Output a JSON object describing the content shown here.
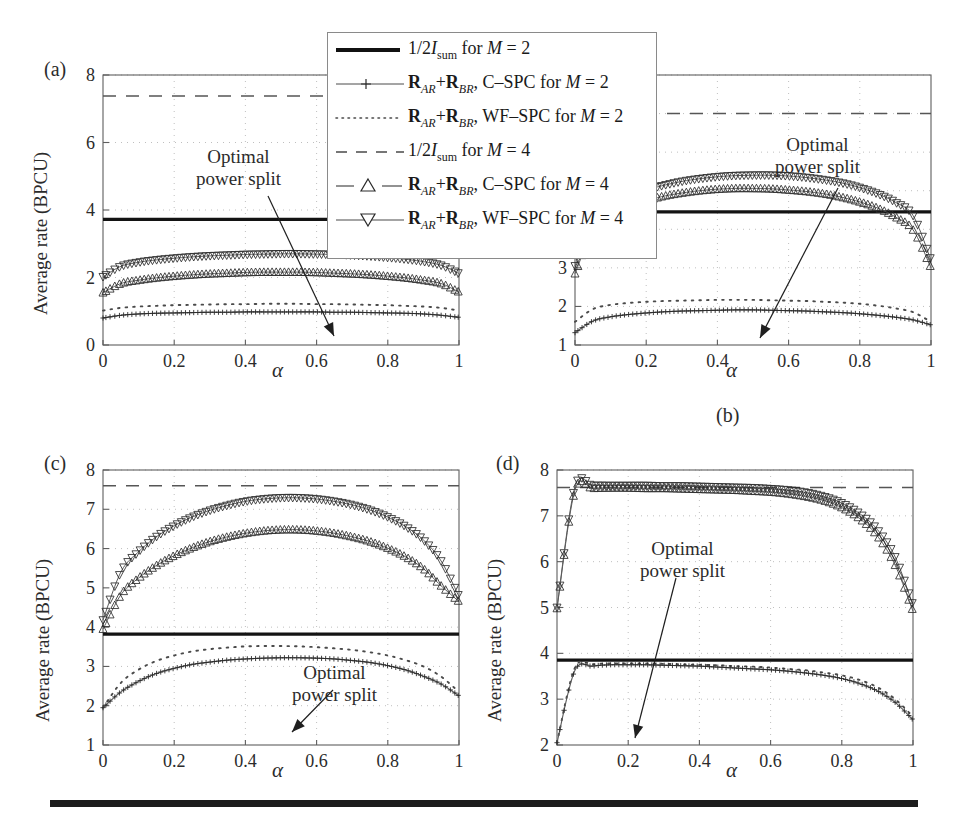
{
  "figure": {
    "bottom_rule_color": "#1c1c1c"
  },
  "legend": {
    "entries": [
      {
        "id": "half-isum-m2",
        "style": "solid-thick",
        "label_html": "1/2<i>I</i><sub>sum</sub> for <i>M</i> = 2",
        "label": "1/2 I_sum for M = 2"
      },
      {
        "id": "rar-rbr-cspc-m2",
        "style": "plus-line",
        "label_html": "<b>R</b><i><sub>AR</sub></i>+<b>R</b><i><sub>BR</sub></i>, C–SPC for <i>M</i> = 2",
        "label": "R_AR+R_BR, C-SPC for M = 2"
      },
      {
        "id": "rar-rbr-wfspc-m2",
        "style": "dotted",
        "label_html": "<b>R</b><i><sub>AR</sub></i>+<b>R</b><i><sub>BR</sub></i>, WF–SPC for <i>M</i> = 2",
        "label": "R_AR+R_BR, WF-SPC for M = 2"
      },
      {
        "id": "half-isum-m4",
        "style": "dashed",
        "label_html": "1/2<i>I</i><sub>sum</sub> for <i>M</i> = 4",
        "label": "1/2 I_sum for M = 4"
      },
      {
        "id": "rar-rbr-cspc-m4",
        "style": "dash-triangle-up",
        "label_html": "<b>R</b><i><sub>AR</sub></i>+<b>R</b><i><sub>BR</sub></i>, C–SPC for <i>M</i> = 4",
        "label": "R_AR+R_BR, C-SPC for M = 4"
      },
      {
        "id": "rar-rbr-wfspc-m4",
        "style": "line-triangle-down",
        "label_html": "<b>R</b><i><sub>AR</sub></i>+<b>R</b><i><sub>BR</sub></i>, WF–SPC for <i>M</i> = 4",
        "label": "R_AR+R_BR, WF-SPC for M = 4"
      }
    ]
  },
  "annotations": {
    "optimal_line1": "Optimal",
    "optimal_line2": "power split"
  },
  "chart_data": [
    {
      "id": "panel-a",
      "type": "line",
      "panel_label": "(a)",
      "title": "",
      "xlabel": "α",
      "ylabel": "Average rate (BPCU)",
      "xlim": [
        0,
        1
      ],
      "ylim": [
        0,
        8
      ],
      "xticks": [
        "0",
        "0.2",
        "0.4",
        "0.6",
        "0.8",
        "1"
      ],
      "xtick_values": [
        0,
        0.2,
        0.4,
        0.6,
        0.8,
        1
      ],
      "yticks": [
        "0",
        "2",
        "4",
        "6",
        "8"
      ],
      "ytick_values": [
        0,
        2,
        4,
        6,
        8
      ],
      "grid": true,
      "annotation": {
        "text": "Optimal power split",
        "arrow_to_x": 0.6,
        "arrow_to_y": 0.3
      },
      "x": [
        0,
        0.05,
        0.1,
        0.15,
        0.2,
        0.25,
        0.3,
        0.35,
        0.4,
        0.45,
        0.5,
        0.55,
        0.6,
        0.65,
        0.7,
        0.75,
        0.8,
        0.85,
        0.9,
        0.95,
        1
      ],
      "series": [
        {
          "name": "1/2 I_sum for M = 2",
          "style": "solid-thick",
          "values": [
            3.72,
            3.72,
            3.72,
            3.72,
            3.72,
            3.72,
            3.72,
            3.72,
            3.72,
            3.72,
            3.72,
            3.72,
            3.72,
            3.72,
            3.72,
            3.72,
            3.72,
            3.72,
            3.72,
            3.72,
            3.72
          ]
        },
        {
          "name": "1/2 I_sum for M = 4",
          "style": "dashed",
          "values": [
            7.38,
            7.38,
            7.38,
            7.38,
            7.38,
            7.38,
            7.38,
            7.38,
            7.38,
            7.38,
            7.38,
            7.38,
            7.38,
            7.38,
            7.38,
            7.38,
            7.38,
            7.38,
            7.38,
            7.38,
            7.38
          ]
        },
        {
          "name": "R_AR+R_BR, WF-SPC for M = 4",
          "style": "line-triangle-down",
          "values": [
            2.02,
            2.33,
            2.45,
            2.52,
            2.57,
            2.61,
            2.64,
            2.66,
            2.68,
            2.69,
            2.7,
            2.7,
            2.69,
            2.68,
            2.66,
            2.63,
            2.59,
            2.54,
            2.47,
            2.36,
            2.12
          ]
        },
        {
          "name": "R_AR+R_BR, C-SPC for M = 4",
          "style": "dash-triangle-up",
          "values": [
            1.55,
            1.82,
            1.92,
            1.99,
            2.04,
            2.08,
            2.11,
            2.13,
            2.15,
            2.16,
            2.16,
            2.16,
            2.15,
            2.13,
            2.11,
            2.08,
            2.04,
            1.99,
            1.92,
            1.82,
            1.57
          ]
        },
        {
          "name": "R_AR+R_BR, WF-SPC for M = 2",
          "style": "dotted",
          "values": [
            1.02,
            1.1,
            1.14,
            1.16,
            1.18,
            1.19,
            1.2,
            1.21,
            1.21,
            1.22,
            1.22,
            1.22,
            1.21,
            1.21,
            1.2,
            1.19,
            1.18,
            1.16,
            1.14,
            1.1,
            1.02
          ]
        },
        {
          "name": "R_AR+R_BR, C-SPC for M = 2",
          "style": "plus-line",
          "values": [
            0.8,
            0.88,
            0.92,
            0.94,
            0.95,
            0.96,
            0.97,
            0.97,
            0.98,
            0.98,
            0.98,
            0.98,
            0.98,
            0.97,
            0.97,
            0.96,
            0.95,
            0.94,
            0.92,
            0.88,
            0.82
          ]
        }
      ]
    },
    {
      "id": "panel-b",
      "type": "line",
      "panel_label": "(b)",
      "title": "",
      "xlabel": "α",
      "ylabel": "Average rate (BPCU)",
      "xlim": [
        0,
        1
      ],
      "ylim": [
        1,
        8
      ],
      "xticks": [
        "0",
        "0.2",
        "0.4",
        "0.6",
        "0.8",
        "1"
      ],
      "xtick_values": [
        0,
        0.2,
        0.4,
        0.6,
        0.8,
        1
      ],
      "yticks": [
        "1",
        "2",
        "3",
        "4",
        "5",
        "6",
        "7",
        "8"
      ],
      "ytick_values": [
        1,
        2,
        3,
        4,
        5,
        6,
        7,
        8
      ],
      "grid": true,
      "annotation": {
        "text": "Optimal power split",
        "arrow_to_x": 0.51,
        "arrow_to_y": 1.05
      },
      "x": [
        0,
        0.05,
        0.1,
        0.15,
        0.2,
        0.25,
        0.3,
        0.35,
        0.4,
        0.45,
        0.5,
        0.55,
        0.6,
        0.65,
        0.7,
        0.75,
        0.8,
        0.85,
        0.9,
        0.95,
        1
      ],
      "series": [
        {
          "name": "1/2 I_sum for M = 2",
          "style": "solid-thick",
          "values": [
            4.45,
            4.45,
            4.45,
            4.45,
            4.45,
            4.45,
            4.45,
            4.45,
            4.45,
            4.45,
            4.45,
            4.45,
            4.45,
            4.45,
            4.45,
            4.45,
            4.45,
            4.45,
            4.45,
            4.45,
            4.45
          ]
        },
        {
          "name": "1/2 I_sum for M = 4",
          "style": "dashed",
          "values": [
            7.0,
            7.0,
            7.0,
            7.0,
            7.0,
            7.0,
            7.0,
            7.0,
            7.0,
            7.0,
            7.0,
            7.0,
            7.0,
            7.0,
            7.0,
            7.0,
            7.0,
            7.0,
            7.0,
            7.0,
            7.0
          ]
        },
        {
          "name": "R_AR+R_BR, WF-SPC for M = 4",
          "style": "line-triangle-down",
          "values": [
            3.05,
            4.2,
            4.6,
            4.85,
            5.02,
            5.14,
            5.24,
            5.31,
            5.36,
            5.39,
            5.4,
            5.4,
            5.38,
            5.34,
            5.28,
            5.2,
            5.08,
            4.92,
            4.7,
            4.35,
            3.2
          ]
        },
        {
          "name": "R_AR+R_BR, C-SPC for M = 4",
          "style": "dash-triangle-up",
          "values": [
            2.85,
            3.95,
            4.35,
            4.58,
            4.74,
            4.86,
            4.94,
            5.0,
            5.04,
            5.06,
            5.06,
            5.05,
            5.02,
            4.98,
            4.92,
            4.83,
            4.71,
            4.55,
            4.32,
            3.98,
            3.0
          ]
        },
        {
          "name": "R_AR+R_BR, WF-SPC for M = 2",
          "style": "dotted",
          "values": [
            1.6,
            1.93,
            2.04,
            2.09,
            2.12,
            2.14,
            2.15,
            2.16,
            2.17,
            2.17,
            2.17,
            2.16,
            2.15,
            2.14,
            2.12,
            2.1,
            2.07,
            2.02,
            1.95,
            1.85,
            1.6
          ]
        },
        {
          "name": "R_AR+R_BR, C-SPC for M = 2",
          "style": "plus-line",
          "values": [
            1.32,
            1.62,
            1.73,
            1.79,
            1.83,
            1.86,
            1.88,
            1.89,
            1.9,
            1.91,
            1.91,
            1.9,
            1.89,
            1.88,
            1.86,
            1.84,
            1.81,
            1.77,
            1.72,
            1.65,
            1.52
          ]
        }
      ]
    },
    {
      "id": "panel-c",
      "type": "line",
      "panel_label": "(c)",
      "title": "",
      "xlabel": "α",
      "ylabel": "Average rate (BPCU)",
      "xlim": [
        0,
        1
      ],
      "ylim": [
        1,
        8
      ],
      "xticks": [
        "0",
        "0.2",
        "0.4",
        "0.6",
        "0.8",
        "1"
      ],
      "xtick_values": [
        0,
        0.2,
        0.4,
        0.6,
        0.8,
        1
      ],
      "yticks": [
        "1",
        "2",
        "3",
        "4",
        "5",
        "6",
        "7",
        "8"
      ],
      "ytick_values": [
        1,
        2,
        3,
        4,
        5,
        6,
        7,
        8
      ],
      "grid": true,
      "annotation": {
        "text": "Optimal power split",
        "arrow_to_x": 0.44,
        "arrow_to_y": 1.15
      },
      "x": [
        0,
        0.05,
        0.1,
        0.15,
        0.2,
        0.25,
        0.3,
        0.35,
        0.4,
        0.45,
        0.5,
        0.55,
        0.6,
        0.65,
        0.7,
        0.75,
        0.8,
        0.85,
        0.9,
        0.95,
        1
      ],
      "series": [
        {
          "name": "1/2 I_sum for M = 2",
          "style": "solid-thick",
          "values": [
            3.82,
            3.82,
            3.82,
            3.82,
            3.82,
            3.82,
            3.82,
            3.82,
            3.82,
            3.82,
            3.82,
            3.82,
            3.82,
            3.82,
            3.82,
            3.82,
            3.82,
            3.82,
            3.82,
            3.82,
            3.82
          ]
        },
        {
          "name": "1/2 I_sum for M = 4",
          "style": "dashed",
          "values": [
            7.6,
            7.6,
            7.6,
            7.6,
            7.6,
            7.6,
            7.6,
            7.6,
            7.6,
            7.6,
            7.6,
            7.6,
            7.6,
            7.6,
            7.6,
            7.6,
            7.6,
            7.6,
            7.6,
            7.6,
            7.6
          ]
        },
        {
          "name": "R_AR+R_BR, WF-SPC for M = 4",
          "style": "line-triangle-down",
          "values": [
            4.18,
            5.4,
            5.92,
            6.3,
            6.58,
            6.8,
            6.97,
            7.1,
            7.2,
            7.26,
            7.29,
            7.29,
            7.26,
            7.2,
            7.11,
            6.98,
            6.8,
            6.56,
            6.22,
            5.68,
            4.78
          ]
        },
        {
          "name": "R_AR+R_BR, C-SPC for M = 4",
          "style": "dash-triangle-up",
          "values": [
            3.95,
            4.82,
            5.25,
            5.57,
            5.82,
            6.02,
            6.18,
            6.3,
            6.39,
            6.45,
            6.48,
            6.48,
            6.45,
            6.39,
            6.3,
            6.18,
            6.01,
            5.79,
            5.49,
            5.05,
            4.65
          ]
        },
        {
          "name": "R_AR+R_BR, WF-SPC for M = 2",
          "style": "dotted",
          "values": [
            1.95,
            2.58,
            2.92,
            3.14,
            3.28,
            3.38,
            3.44,
            3.48,
            3.51,
            3.52,
            3.52,
            3.51,
            3.49,
            3.46,
            3.42,
            3.36,
            3.28,
            3.16,
            3.0,
            2.74,
            2.35
          ]
        },
        {
          "name": "R_AR+R_BR, C-SPC for M = 2",
          "style": "plus-line",
          "values": [
            1.95,
            2.35,
            2.62,
            2.82,
            2.95,
            3.05,
            3.11,
            3.16,
            3.19,
            3.21,
            3.22,
            3.22,
            3.21,
            3.19,
            3.15,
            3.1,
            3.02,
            2.91,
            2.75,
            2.55,
            2.25
          ]
        }
      ]
    },
    {
      "id": "panel-d",
      "type": "line",
      "panel_label": "(d)",
      "title": "",
      "xlabel": "α",
      "ylabel": "Average rate (BPCU)",
      "xlim": [
        0,
        1
      ],
      "ylim": [
        2,
        8
      ],
      "xticks": [
        "0",
        "0.2",
        "0.4",
        "0.6",
        "0.8",
        "1"
      ],
      "xtick_values": [
        0,
        0.2,
        0.4,
        0.6,
        0.8,
        1
      ],
      "yticks": [
        "2",
        "3",
        "4",
        "5",
        "6",
        "7",
        "8"
      ],
      "ytick_values": [
        2,
        3,
        4,
        5,
        6,
        7,
        8
      ],
      "grid": true,
      "annotation": {
        "text": "Optimal power split",
        "arrow_to_x": 0.21,
        "arrow_to_y": 2.05
      },
      "x": [
        0,
        0.05,
        0.1,
        0.15,
        0.2,
        0.25,
        0.3,
        0.35,
        0.4,
        0.45,
        0.5,
        0.55,
        0.6,
        0.65,
        0.7,
        0.75,
        0.8,
        0.85,
        0.9,
        0.95,
        1
      ],
      "series": [
        {
          "name": "1/2 I_sum for M = 2",
          "style": "solid-thick",
          "values": [
            3.85,
            3.85,
            3.85,
            3.85,
            3.85,
            3.85,
            3.85,
            3.85,
            3.85,
            3.85,
            3.85,
            3.85,
            3.85,
            3.85,
            3.85,
            3.85,
            3.85,
            3.85,
            3.85,
            3.85,
            3.85
          ]
        },
        {
          "name": "1/2 I_sum for M = 4",
          "style": "dashed",
          "values": [
            7.62,
            7.62,
            7.62,
            7.62,
            7.62,
            7.62,
            7.62,
            7.62,
            7.62,
            7.62,
            7.62,
            7.62,
            7.62,
            7.62,
            7.62,
            7.62,
            7.62,
            7.62,
            7.62,
            7.62,
            7.62
          ]
        },
        {
          "name": "R_AR+R_BR, WF-SPC for M = 4",
          "style": "line-triangle-down",
          "values": [
            5.0,
            7.62,
            7.66,
            7.66,
            7.66,
            7.66,
            7.65,
            7.65,
            7.64,
            7.63,
            7.62,
            7.61,
            7.59,
            7.56,
            7.51,
            7.42,
            7.28,
            7.05,
            6.7,
            6.1,
            5.05
          ]
        },
        {
          "name": "R_AR+R_BR, C-SPC for M = 4",
          "style": "dash-triangle-up",
          "values": [
            4.98,
            7.55,
            7.6,
            7.61,
            7.61,
            7.6,
            7.6,
            7.59,
            7.58,
            7.57,
            7.56,
            7.54,
            7.52,
            7.48,
            7.42,
            7.33,
            7.18,
            6.94,
            6.56,
            5.92,
            4.92
          ]
        },
        {
          "name": "R_AR+R_BR, WF-SPC for M = 2",
          "style": "dotted",
          "values": [
            2.05,
            3.68,
            3.76,
            3.78,
            3.78,
            3.78,
            3.77,
            3.76,
            3.75,
            3.74,
            3.72,
            3.71,
            3.69,
            3.66,
            3.63,
            3.58,
            3.52,
            3.42,
            3.26,
            3.0,
            2.62
          ]
        },
        {
          "name": "R_AR+R_BR, C-SPC for M = 2",
          "style": "plus-line",
          "values": [
            2.05,
            3.62,
            3.72,
            3.75,
            3.75,
            3.75,
            3.74,
            3.73,
            3.72,
            3.7,
            3.68,
            3.66,
            3.64,
            3.61,
            3.57,
            3.52,
            3.45,
            3.34,
            3.18,
            2.93,
            2.55
          ]
        }
      ]
    }
  ]
}
